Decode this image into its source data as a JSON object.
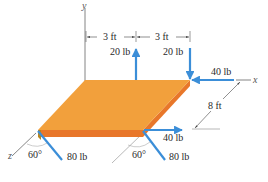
{
  "diagram": {
    "type": "3D free-body diagram of a plate",
    "axes": {
      "x_label": "x",
      "y_label": "y",
      "z_label": "z"
    },
    "dimensions": {
      "dim_left": "3 ft",
      "dim_right": "3 ft",
      "dim_depth": "8 ft"
    },
    "forces": {
      "top_mid_up": "20 lb",
      "top_right_down": "20 lb",
      "back_right_horizontal": "40 lb",
      "front_right_horizontal": "40 lb",
      "front_left_inclined": "80 lb",
      "front_right_inclined": "80 lb"
    },
    "angles": {
      "front_left": "60°",
      "front_right": "60°"
    },
    "colors": {
      "plate_top": "#F2A03C",
      "plate_side": "#E8772A",
      "arrow": "#3B8ED8",
      "lines": "#555555"
    }
  }
}
